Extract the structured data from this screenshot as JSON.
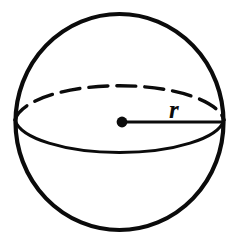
{
  "figure": {
    "type": "geometry-diagram",
    "shape_name": "sphere",
    "background_color": "#ffffff",
    "stroke_color": "#0b0b0b"
  },
  "labels": {
    "radius": "r"
  },
  "geometry": {
    "canvas": {
      "width": 239,
      "height": 242
    },
    "sphere_outline": {
      "name": "sphere-outline",
      "center_x": 119.5,
      "center_y": 122,
      "radius_x": 106,
      "radius_y": 110,
      "stroke_width": 4.2
    },
    "equator_front": {
      "name": "equator-front-arc",
      "center_x": 119.5,
      "center_y": 120,
      "radius_x": 105,
      "radius_y": 36,
      "stroke_width": 3.0,
      "style": "solid"
    },
    "equator_back": {
      "name": "equator-back-arc",
      "center_x": 119.5,
      "center_y": 120,
      "radius_x": 105,
      "radius_y": 38,
      "stroke_width": 3.4,
      "style": "dashed",
      "dash_pattern": "19 9"
    },
    "center_point": {
      "name": "center-point",
      "x": 122,
      "y": 122,
      "radius": 5.4
    },
    "radius_line": {
      "name": "radius-line",
      "x1": 122,
      "y1": 122,
      "x2": 225,
      "y2": 122,
      "stroke_width": 3.2
    },
    "radius_label_position": {
      "x": 169,
      "y": 117
    }
  }
}
